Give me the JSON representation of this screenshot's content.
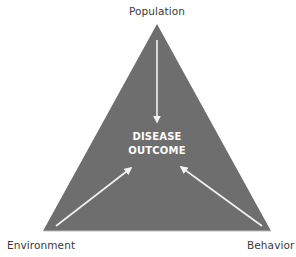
{
  "diagram": {
    "type": "epidemiologic-triangle",
    "vertices": {
      "top": "Population",
      "bottom_left": "Environment",
      "bottom_right": "Behavior"
    },
    "center": {
      "line1": "DISEASE",
      "line2": "OUTCOME"
    },
    "arrows": [
      {
        "from": "Population",
        "to": "DISEASE OUTCOME"
      },
      {
        "from": "Environment",
        "to": "DISEASE OUTCOME"
      },
      {
        "from": "Behavior",
        "to": "DISEASE OUTCOME"
      }
    ],
    "colors": {
      "triangle_fill": "#6e6e6e",
      "arrow": "#f2f2f2",
      "center_text": "#ffffff",
      "label_text": "#3a3a3a"
    }
  }
}
